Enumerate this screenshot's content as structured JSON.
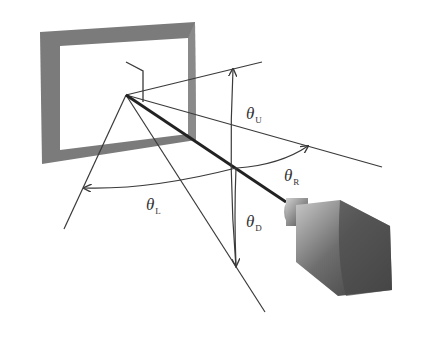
{
  "diagram": {
    "colors": {
      "background": "#ffffff",
      "line": "#3a3a3a",
      "frame": "#777777",
      "camera": "#5a5a5a"
    },
    "labels": {
      "theta_u": {
        "symbol": "θ",
        "sub": "U"
      },
      "theta_r": {
        "symbol": "θ",
        "sub": "R"
      },
      "theta_l": {
        "symbol": "θ",
        "sub": "L"
      },
      "theta_d": {
        "symbol": "θ",
        "sub": "D"
      }
    },
    "elements": [
      "display-frame",
      "normal-axis",
      "camera",
      "up-ray",
      "right-ray",
      "left-ray",
      "down-ray"
    ]
  }
}
